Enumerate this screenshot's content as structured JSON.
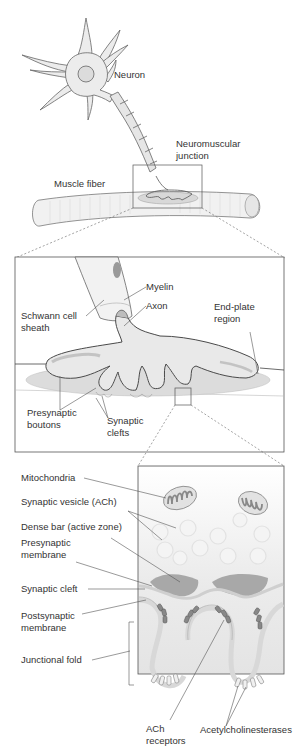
{
  "colors": {
    "outline": "#555555",
    "cell_fill": "#ebebeb",
    "terminal_fill": "#e2e2e2",
    "endplate_fill": "#d8d8d8",
    "dark_gray": "#9a9a9a",
    "text": "#333333",
    "background": "#ffffff"
  },
  "panels": {
    "overview": {
      "labels": {
        "neuron": "Neuron",
        "nmj_line1": "Neuromuscular",
        "nmj_line2": "junction",
        "muscle_fiber": "Muscle fiber"
      }
    },
    "junction_detail": {
      "labels": {
        "myelin": "Myelin",
        "axon": "Axon",
        "schwann_line1": "Schwann cell",
        "schwann_line2": "sheath",
        "endplate_line1": "End-plate",
        "endplate_line2": "region",
        "boutons_line1": "Presynaptic",
        "boutons_line2": "boutons",
        "clefts_line1": "Synaptic",
        "clefts_line2": "clefts"
      }
    },
    "synapse_detail": {
      "labels": {
        "mitochondria": "Mitochondria",
        "synaptic_vesicle": "Synaptic vesicle (ACh)",
        "dense_bar": "Dense bar (active zone)",
        "presyn_line1": "Presynaptic",
        "presyn_line2": "membrane",
        "synaptic_cleft": "Synaptic cleft",
        "postsyn_line1": "Postsynaptic",
        "postsyn_line2": "membrane",
        "junctional_fold": "Junctional fold",
        "ach_line1": "ACh",
        "ach_line2": "receptors",
        "acetylcholinesterases": "Acetylcholinesterases"
      }
    }
  }
}
